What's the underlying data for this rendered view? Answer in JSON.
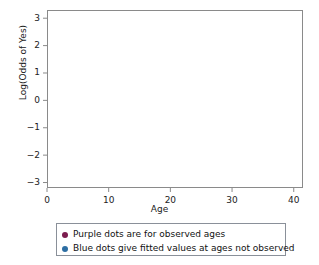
{
  "chart_data": {
    "type": "scatter",
    "title": "",
    "xlabel": "Age",
    "ylabel": "Log(Odds of Yes)",
    "xlim": [
      0,
      41.5
    ],
    "ylim": [
      -3.2,
      3.3
    ],
    "xticks": [
      "0",
      "10",
      "20",
      "30",
      "40"
    ],
    "xtick_values": [
      0,
      10,
      20,
      30,
      40
    ],
    "yticks": [
      "3",
      "2",
      "1",
      "0",
      "−1",
      "−2",
      "−3"
    ],
    "ytick_values": [
      3,
      2,
      1,
      0,
      -1,
      -2,
      -3
    ],
    "grid": false,
    "legend_position": "below-axes",
    "fit_line": {
      "name": "Fitted logistic regression line",
      "color": "#c1663f",
      "intercept": 3.28,
      "slope": -0.1558,
      "x_start": 0.6,
      "x_end": 41.3
    },
    "series": [
      {
        "name": "Blue dots give fitted values at ages not observed",
        "color": "#2d4a6b",
        "marker": "circle",
        "points": [
          {
            "x": 2.0,
            "y": 2.87
          },
          {
            "x": 11.9,
            "y": 1.36
          },
          {
            "x": 20.0,
            "y": 0.13
          },
          {
            "x": 29.9,
            "y": -1.37
          }
        ]
      },
      {
        "name": "Purple dots are for observed ages",
        "color": "#7c1c4e",
        "marker": "circle",
        "points": [
          {
            "x": 13.8,
            "y": 1.09
          },
          {
            "x": 14.4,
            "y": 0.92
          },
          {
            "x": 15.1,
            "y": 0.82
          },
          {
            "x": 15.8,
            "y": 0.76
          },
          {
            "x": 16.6,
            "y": 0.62
          },
          {
            "x": 17.2,
            "y": 0.53
          },
          {
            "x": 17.8,
            "y": 0.46
          }
        ]
      }
    ]
  },
  "legend": {
    "items": [
      {
        "label": "Purple dots are for observed ages",
        "color": "#7c1c4e"
      },
      {
        "label": "Blue dots give fitted values at ages not observed",
        "color": "#2d6ea3"
      }
    ]
  }
}
